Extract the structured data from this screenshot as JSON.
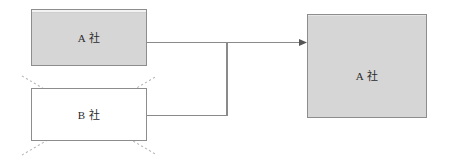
{
  "diagram": {
    "background_color": "#ffffff",
    "canvas": {
      "width": 449,
      "height": 167
    },
    "nodes": [
      {
        "id": "company-a-source",
        "label": "A  社",
        "role": "source-company",
        "fill_color": "#d6d6d6",
        "border_color": "#8d8d8d",
        "struck_out": false
      },
      {
        "id": "company-b-dissolved",
        "label": "B  社",
        "role": "dissolved-company",
        "fill_color": "#ffffff",
        "border_color": "#8d8d8d",
        "struck_out": true
      },
      {
        "id": "company-a-surviving",
        "label": "A  社",
        "role": "surviving-company",
        "fill_color": "#d6d6d6",
        "border_color": "#8d8d8d",
        "struck_out": false
      }
    ],
    "connectors": [
      {
        "id": "merge-connector",
        "from": [
          "company-a-source",
          "company-b-dissolved"
        ],
        "to": "company-a-surviving",
        "style": "orthogonal-merge",
        "color": "#8a8a8a",
        "arrow_head": "filled-triangle"
      }
    ],
    "annotations": [
      {
        "id": "strikeout-cross",
        "target": "company-b-dissolved",
        "shape": "x-cross",
        "color": "#b4b4b4",
        "line_style": "dotted"
      }
    ]
  }
}
